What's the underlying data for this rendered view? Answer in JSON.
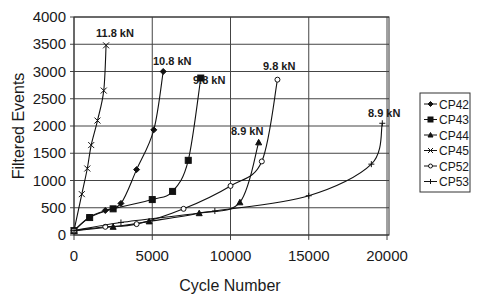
{
  "chart_data": {
    "type": "line",
    "title": "",
    "xlabel": "Cycle Number",
    "ylabel": "Filtered Events",
    "xlim": [
      0,
      20000
    ],
    "ylim": [
      0,
      4000
    ],
    "xticks": [
      0,
      5000,
      10000,
      15000,
      20000
    ],
    "yticks": [
      0,
      500,
      1000,
      1500,
      2000,
      2500,
      3000,
      3500,
      4000
    ],
    "grid": true,
    "legend_position": "right",
    "series": [
      {
        "name": "CP42",
        "marker": "diamond",
        "load_label": "10.8 kN",
        "x": [
          0,
          1000,
          2000,
          3000,
          4000,
          5100,
          5700
        ],
        "y": [
          80,
          330,
          450,
          580,
          1200,
          1930,
          3000
        ]
      },
      {
        "name": "CP43",
        "marker": "square",
        "load_label": "9.8 kN",
        "x": [
          0,
          1000,
          2500,
          5000,
          6300,
          7300,
          8100
        ],
        "y": [
          80,
          320,
          480,
          650,
          800,
          1370,
          2880
        ]
      },
      {
        "name": "CP44",
        "marker": "triangle",
        "load_label": "8.9 kN",
        "x": [
          0,
          2500,
          4800,
          8000,
          10600,
          11800
        ],
        "y": [
          80,
          150,
          250,
          400,
          600,
          1700
        ]
      },
      {
        "name": "CP45",
        "marker": "x",
        "load_label": "11.8 kN",
        "x": [
          0,
          500,
          850,
          1100,
          1500,
          1900,
          2050
        ],
        "y": [
          80,
          750,
          1220,
          1650,
          2100,
          2650,
          3480
        ]
      },
      {
        "name": "CP52",
        "marker": "circle",
        "load_label": "9.8 kN",
        "x": [
          0,
          2000,
          4000,
          7000,
          10000,
          12000,
          13000
        ],
        "y": [
          80,
          150,
          200,
          480,
          900,
          1350,
          2850
        ]
      },
      {
        "name": "CP53",
        "marker": "plus",
        "load_label": "8.9 kN",
        "x": [
          0,
          3000,
          9000,
          15000,
          19000,
          19700
        ],
        "y": [
          80,
          230,
          440,
          720,
          1300,
          2050
        ]
      }
    ],
    "annotations": [
      {
        "text": "11.8 kN",
        "series": "CP45"
      },
      {
        "text": "10.8 kN",
        "series": "CP42"
      },
      {
        "text": "9.8 kN",
        "series": "CP43"
      },
      {
        "text": "9.8 kN",
        "series": "CP52"
      },
      {
        "text": "8.9 kN",
        "series": "CP44"
      },
      {
        "text": "8.9 kN",
        "series": "CP53"
      }
    ]
  },
  "labels": {
    "xlabel": "Cycle Number",
    "ylabel": "Filtered Events"
  },
  "caption": "Figure: Filtered events versus cycle number for each coupon"
}
